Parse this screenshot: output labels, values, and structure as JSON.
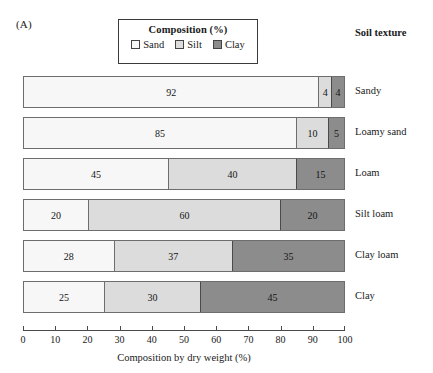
{
  "panel_label": "(A)",
  "legend": {
    "title": "Composition (%)",
    "entries": [
      {
        "label": "Sand",
        "color": "#f7f7f7",
        "swatch": "sand-swatch"
      },
      {
        "label": "Silt",
        "color": "#dcdcdc",
        "swatch": "silt-swatch"
      },
      {
        "label": "Clay",
        "color": "#8c8c8c",
        "swatch": "clay-swatch"
      }
    ]
  },
  "column_header": "Soil texture",
  "chart_data": {
    "type": "bar",
    "orientation": "horizontal",
    "stacked": true,
    "title": "Composition (%)",
    "xlabel": "Composition by dry weight (%)",
    "ylabel": "Soil texture",
    "xlim": [
      0,
      100
    ],
    "xticks": [
      0,
      10,
      20,
      30,
      40,
      50,
      60,
      70,
      80,
      90,
      100
    ],
    "xticklabels": [
      "0",
      "10",
      "20",
      "30",
      "40",
      "50",
      "60",
      "70",
      "80",
      "90",
      "100"
    ],
    "grid": false,
    "legend_position": "top-center",
    "categories": [
      "Sandy",
      "Loamy sand",
      "Loam",
      "Silt loam",
      "Clay loam",
      "Clay"
    ],
    "series": [
      {
        "name": "Sand",
        "color": "#f7f7f7",
        "values": [
          92,
          85,
          45,
          20,
          28,
          25
        ]
      },
      {
        "name": "Silt",
        "color": "#dcdcdc",
        "values": [
          4,
          10,
          40,
          60,
          37,
          30
        ]
      },
      {
        "name": "Clay",
        "color": "#8c8c8c",
        "values": [
          4,
          5,
          15,
          20,
          35,
          45
        ]
      }
    ],
    "rows": [
      {
        "label": "Sandy",
        "sand": 92,
        "silt": 4,
        "clay": 4
      },
      {
        "label": "Loamy sand",
        "sand": 85,
        "silt": 10,
        "clay": 5
      },
      {
        "label": "Loam",
        "sand": 45,
        "silt": 40,
        "clay": 15
      },
      {
        "label": "Silt loam",
        "sand": 20,
        "silt": 60,
        "clay": 20
      },
      {
        "label": "Clay loam",
        "sand": 28,
        "silt": 37,
        "clay": 35
      },
      {
        "label": "Clay",
        "sand": 25,
        "silt": 30,
        "clay": 45
      }
    ]
  },
  "axis_title": "Composition by dry weight (%)"
}
